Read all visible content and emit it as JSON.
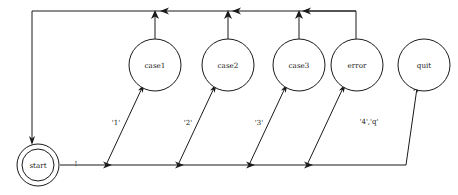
{
  "diagram": {
    "type": "state-machine",
    "background_color": "#ffffff",
    "line_color": "#1a1a1a",
    "nodes": [
      {
        "id": "start",
        "label": "start",
        "shape": "double-circle",
        "cx": 38,
        "cy": 165,
        "r_outer": 21,
        "r_inner": 16
      },
      {
        "id": "case1",
        "label": "case1",
        "shape": "circle",
        "cx": 155,
        "cy": 65,
        "r": 26
      },
      {
        "id": "case2",
        "label": "case2",
        "shape": "circle",
        "cx": 228,
        "cy": 65,
        "r": 26
      },
      {
        "id": "case3",
        "label": "case3",
        "shape": "circle",
        "cx": 299,
        "cy": 65,
        "r": 26
      },
      {
        "id": "error",
        "label": "error",
        "shape": "circle",
        "cx": 357,
        "cy": 65,
        "r": 26
      },
      {
        "id": "quit",
        "label": "quit",
        "shape": "circle",
        "cx": 424,
        "cy": 65,
        "r": 26
      }
    ],
    "edge_labels": [
      {
        "id": "start-out",
        "text": "!",
        "x": 76,
        "y": 165
      },
      {
        "id": "to-case1",
        "text": "'1'",
        "x": 116,
        "y": 123
      },
      {
        "id": "to-case2",
        "text": "'2'",
        "x": 188,
        "y": 123
      },
      {
        "id": "to-case3",
        "text": "'3'",
        "x": 259,
        "y": 123
      },
      {
        "id": "to-quit",
        "text": "'4','q'",
        "x": 369,
        "y": 122
      }
    ],
    "edges": [
      {
        "from": "start",
        "to": "case1",
        "label": "'1'"
      },
      {
        "from": "start",
        "to": "case2",
        "label": "'2'"
      },
      {
        "from": "start",
        "to": "case3",
        "label": "'3'"
      },
      {
        "from": "start",
        "to": "error",
        "label": ""
      },
      {
        "from": "start",
        "to": "quit",
        "label": "'4','q'"
      },
      {
        "from": "case1",
        "to": "start",
        "label": ""
      },
      {
        "from": "case2",
        "to": "start",
        "label": ""
      },
      {
        "from": "case3",
        "to": "start",
        "label": ""
      },
      {
        "from": "error",
        "to": "start",
        "label": ""
      }
    ]
  }
}
